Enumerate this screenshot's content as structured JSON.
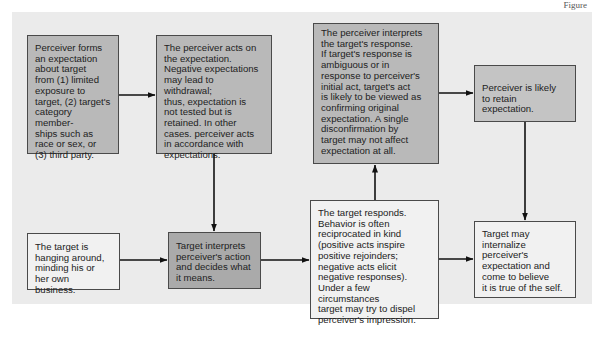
{
  "header_fragment": "Figure",
  "colors": {
    "panel_bg": "#ebebeb",
    "box_dark": "#b9b9b9",
    "box_mid": "#c4c4c4",
    "box_light": "#f1f1f1",
    "box_darker": "#aaaaaa",
    "border": "#4a4a4a",
    "arrow": "#111111"
  },
  "boxes": [
    {
      "id": "perceiver-forms-expectation",
      "text": "Perceiver forms\nan expectation\nabout target\nfrom (1) limited\nexposure to\ntarget, (2) target's\ncategory member-\nships such as\nrace or sex, or\n(3) third party."
    },
    {
      "id": "perceiver-acts",
      "text": "The perceiver acts on\nthe expectation.\nNegative expectations\nmay lead to withdrawal;\nthus, expectation is\nnot tested but is\nretained. In other\ncases. perceiver acts\nin accordance with\nexpectations."
    },
    {
      "id": "perceiver-interprets-response",
      "text": "The perceiver interprets\nthe target's response.\nIf target's response is\nambiguous or in\nresponse to perceiver's\ninitial act, target's act\nis likely to be viewed as\nconfirming original\nexpectation. A single\ndisconfirmation by\ntarget may not affect\nexpectation at all."
    },
    {
      "id": "perceiver-retains-expectation",
      "text": "Perceiver is likely\nto retain expectation."
    },
    {
      "id": "target-minding-business",
      "text": "The target is\nhanging around,\nminding his or\nher own business."
    },
    {
      "id": "target-interprets-action",
      "text": "Target interprets\nperceiver's action\nand decides what\nit means."
    },
    {
      "id": "target-responds",
      "text": "The target responds.\nBehavior is often\nreciprocated in kind\n(positive acts inspire\npositive rejoinders;\nnegative acts elicit\nnegative responses).\nUnder a few circumstances\ntarget may try to dispel\nperceiver's impression."
    },
    {
      "id": "target-internalizes",
      "text": "Target may\ninternalize\nperceiver's\nexpectation and\ncome to believe\nit is true of the self."
    }
  ],
  "edges": [
    {
      "from": "perceiver-forms-expectation",
      "to": "perceiver-acts"
    },
    {
      "from": "perceiver-acts",
      "to": "target-interprets-action"
    },
    {
      "from": "target-minding-business",
      "to": "target-interprets-action"
    },
    {
      "from": "target-interprets-action",
      "to": "target-responds"
    },
    {
      "from": "target-responds",
      "to": "perceiver-interprets-response"
    },
    {
      "from": "perceiver-interprets-response",
      "to": "perceiver-retains-expectation"
    },
    {
      "from": "perceiver-retains-expectation",
      "to": "target-internalizes"
    },
    {
      "from": "target-responds",
      "to": "target-internalizes"
    }
  ]
}
